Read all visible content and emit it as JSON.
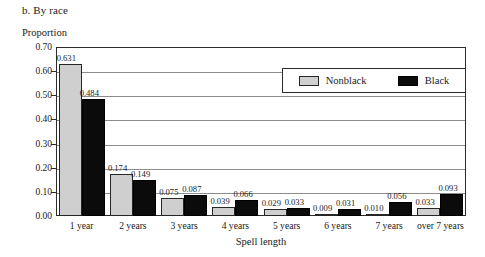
{
  "figure": {
    "title": "b. By race",
    "y_axis_title": "Proportion",
    "x_axis_title": "Spell length"
  },
  "chart_data": {
    "type": "bar",
    "title": "b. By race",
    "xlabel": "Spell length",
    "ylabel": "Proportion",
    "ylim": [
      0.0,
      0.7
    ],
    "ytick_step": 0.1,
    "yticks": [
      "0.00",
      "0.10",
      "0.20",
      "0.30",
      "0.40",
      "0.50",
      "0.60",
      "0.70"
    ],
    "ytick_values": [
      0.0,
      0.1,
      0.2,
      0.3,
      0.4,
      0.5,
      0.6,
      0.7
    ],
    "grid": true,
    "legend_position": "top-right",
    "categories": [
      "1 year",
      "2 years",
      "3 years",
      "4 years",
      "5 years",
      "6 years",
      "7 years",
      "over 7 years"
    ],
    "series": [
      {
        "name": "Nonblack",
        "color": "#cfcfcf",
        "values": [
          0.631,
          0.174,
          0.075,
          0.039,
          0.029,
          0.009,
          0.01,
          0.033
        ],
        "labels": [
          "0.631",
          "0.174",
          "0.075",
          "0.039",
          "0.029",
          "0.009",
          "0.010",
          "0.033"
        ]
      },
      {
        "name": "Black",
        "color": "#0b0b0b",
        "values": [
          0.484,
          0.149,
          0.087,
          0.066,
          0.033,
          0.031,
          0.056,
          0.093
        ],
        "labels": [
          "0.484",
          "0.149",
          "0.087",
          "0.066",
          "0.033",
          "0.031",
          "0.056",
          "0.093"
        ]
      }
    ]
  }
}
